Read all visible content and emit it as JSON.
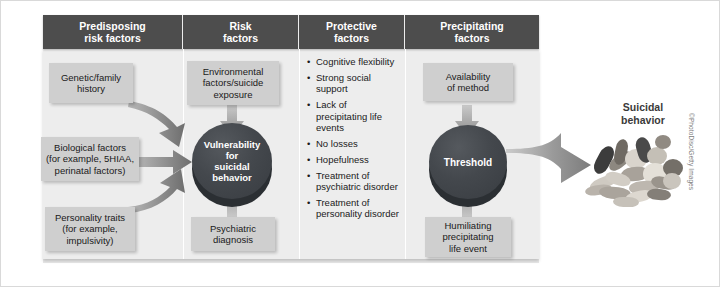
{
  "diagram": {
    "columns": [
      {
        "id": "predisposing",
        "header": "Predisposing\nrisk factors"
      },
      {
        "id": "risk",
        "header": "Risk\nfactors"
      },
      {
        "id": "protective",
        "header": "Protective\nfactors"
      },
      {
        "id": "precipitating",
        "header": "Precipitating\nfactors"
      }
    ],
    "headers": {
      "predisposing_line1": "Predisposing",
      "predisposing_line2": "risk factors",
      "risk_line1": "Risk",
      "risk_line2": "factors",
      "protective_line1": "Protective",
      "protective_line2": "factors",
      "precipitating_line1": "Precipitating",
      "precipitating_line2": "factors"
    },
    "predisposing_boxes": [
      {
        "lines": [
          "Genetic/family",
          "history"
        ]
      },
      {
        "lines": [
          "Biological factors",
          "(for example, 5HIAA,",
          "perinatal factors)"
        ]
      },
      {
        "lines": [
          "Personality traits",
          "(for example,",
          "impulsivity)"
        ]
      }
    ],
    "risk_boxes": [
      {
        "lines": [
          "Environmental",
          "factors/suicide",
          "exposure"
        ]
      },
      {
        "lines": [
          "Psychiatric",
          "diagnosis"
        ]
      }
    ],
    "vulnerability_disc": {
      "lines": [
        "Vulnerability",
        "for",
        "suicidal",
        "behavior"
      ]
    },
    "protective_bullets": [
      "Cognitive flexibility",
      "Strong social support",
      "Lack of precipitating life events",
      "No losses",
      "Hopefulness",
      "Treatment of psychiatric disorder",
      "Treatment of personality disorder"
    ],
    "precipitating_boxes": [
      {
        "lines": [
          "Availability",
          "of method"
        ]
      },
      {
        "lines": [
          "Humiliating",
          "precipitating",
          "life event"
        ]
      }
    ],
    "threshold_disc": {
      "lines": [
        "Threshold"
      ]
    },
    "outcome": {
      "line1": "Suicidal",
      "line2": "behavior"
    },
    "credit": "©PhotoDisc/Getty Images",
    "colors": {
      "header_bar": "#4d4d4d",
      "panel_bg": "#ededed",
      "box_fill": "#cfcfcf",
      "disc_fill": "#44484d",
      "disc_shadow": "#2b2f33",
      "arrow_fill": "#8d8d8d",
      "text": "#1a1a1a",
      "header_text": "#ffffff"
    }
  }
}
